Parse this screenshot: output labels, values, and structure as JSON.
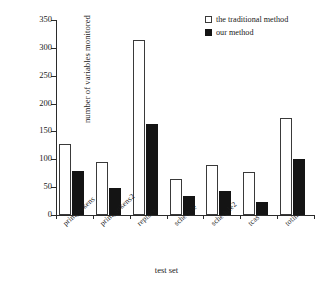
{
  "chart_data": {
    "type": "bar",
    "title": "",
    "xlabel": "test set",
    "ylabel": "number of variables monitored",
    "categories": [
      "print_tokens",
      "print_tokens2",
      "replace",
      "schedule",
      "schedule2",
      "tcas",
      "totinfo"
    ],
    "series": [
      {
        "name": "the traditional method",
        "color": "#ffffff",
        "values": [
          128,
          95,
          315,
          65,
          89,
          78,
          175
        ]
      },
      {
        "name": "our method",
        "color": "#141414",
        "values": [
          79,
          48,
          163,
          35,
          43,
          24,
          100
        ]
      }
    ],
    "ylim": [
      0,
      350
    ],
    "yticks": [
      0,
      50,
      100,
      150,
      200,
      250,
      300,
      350
    ],
    "ytick_labels": [
      "0",
      "50",
      "100",
      "150",
      "200",
      "250",
      "300",
      "350"
    ],
    "grid": false,
    "legend_position": "top-right"
  }
}
